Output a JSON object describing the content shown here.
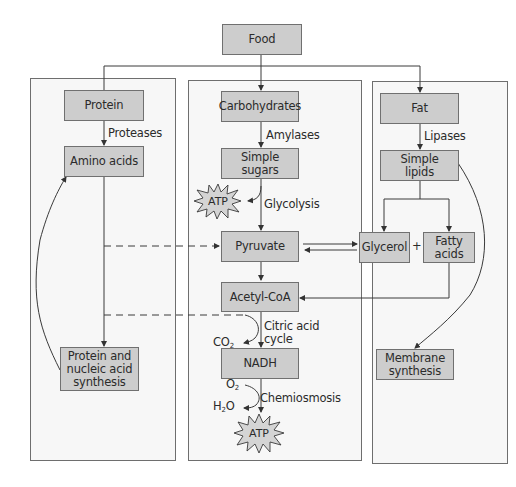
{
  "diagram": {
    "title": "Food",
    "columns": {
      "protein": {
        "source": "Protein",
        "enzyme": "Proteases",
        "product": "Amino acids",
        "synthesis": "Protein and\nnucleic acid\nsynthesis"
      },
      "carbohydrate": {
        "source": "Carbohydrates",
        "enzyme": "Amylases",
        "product": "Simple sugars",
        "atp_top": "ATP",
        "glycolysis": "Glycolysis",
        "pyruvate": "Pyruvate",
        "acetyl_coa": "Acetyl-CoA",
        "citric_acid": "Citric acid\ncycle",
        "co2": "CO",
        "co2_sub": "2",
        "nadh": "NADH",
        "o2": "O",
        "o2_sub": "2",
        "h2o_h": "H",
        "h2o_sub": "2",
        "h2o_o": "O",
        "chemiosmosis": "Chemiosmosis",
        "atp_bottom": "ATP"
      },
      "fat": {
        "source": "Fat",
        "enzyme": "Lipases",
        "product": "Simple\nlipids",
        "glycerol": "Glycerol",
        "plus": "+",
        "fatty_acids": "Fatty\nacids",
        "membrane": "Membrane\nsynthesis"
      }
    },
    "colors": {
      "box_fill": "#cdcdcd",
      "panel_fill": "#f7f7f7",
      "line": "#3a3a3a"
    }
  }
}
